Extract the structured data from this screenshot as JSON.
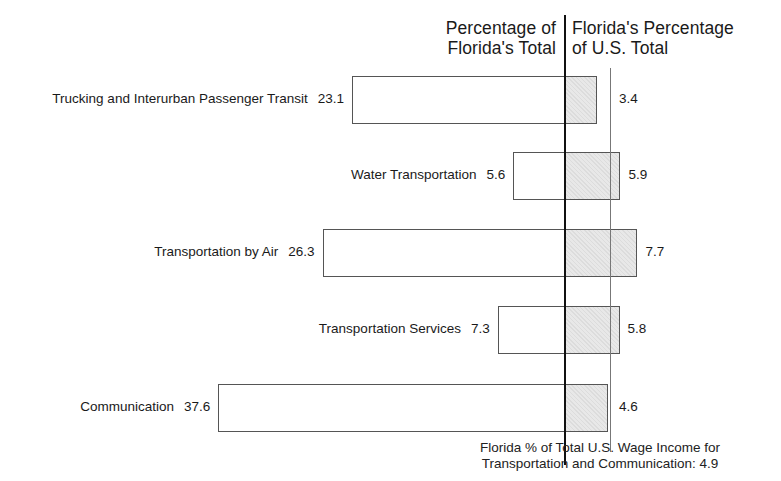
{
  "chart_data": {
    "type": "bar",
    "orientation": "horizontal-diverging",
    "title": "",
    "left_header": "Percentage of Florida's Total",
    "right_header": "Florida's Percentage of U.S. Total",
    "categories": [
      "Trucking and Interurban Passenger Transit",
      "Water Transportation",
      "Transportation by Air",
      "Transportation Services",
      "Communication"
    ],
    "series": [
      {
        "name": "Percentage of Florida's Total",
        "values": [
          23.1,
          5.6,
          26.3,
          7.3,
          37.6
        ],
        "side": "left",
        "fill": "#ffffff"
      },
      {
        "name": "Florida's Percentage of U.S. Total",
        "values": [
          3.4,
          5.9,
          7.7,
          5.8,
          4.6
        ],
        "side": "right",
        "fill": "#e2e2e2"
      }
    ],
    "reference_line": {
      "value": 4.9,
      "label": "Florida % of Total U.S. Wage Income for Transportation and Communication: 4.9"
    },
    "grid": false
  },
  "header": {
    "left_line1": "Percentage of",
    "left_line2": "Florida's Total",
    "right_line1": "Florida's Percentage",
    "right_line2": "of U.S. Total"
  },
  "rows": [
    {
      "label": "Trucking and Interurban Passenger Transit",
      "left": "23.1",
      "right": "3.4"
    },
    {
      "label": "Water Transportation",
      "left": "5.6",
      "right": "5.9"
    },
    {
      "label": "Transportation by Air",
      "left": "26.3",
      "right": "7.7"
    },
    {
      "label": "Transportation Services",
      "left": "7.3",
      "right": "5.8"
    },
    {
      "label": "Communication",
      "left": "37.6",
      "right": "4.6"
    }
  ],
  "footer": {
    "line1": "Florida % of Total U.S. Wage Income for",
    "line2": "Transportation and Communication: 4.9"
  }
}
